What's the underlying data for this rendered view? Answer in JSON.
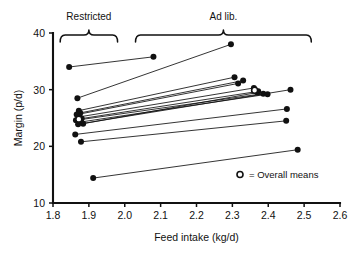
{
  "chart_data": {
    "type": "scatter",
    "title": "",
    "xlabel": "Feed intake (kg/d)",
    "ylabel": "Margin (p/d)",
    "xlim": [
      1.8,
      2.6
    ],
    "ylim": [
      10,
      40
    ],
    "xticks": [
      "1.8",
      "1.9",
      "2.0",
      "2.1",
      "2.2",
      "2.3",
      "2.4",
      "2.5",
      "2.6"
    ],
    "yticks": [
      "10",
      "20",
      "30",
      "40"
    ],
    "grid": false,
    "legend_position": "lower-right",
    "legend": [
      {
        "marker": "open-circle",
        "label": "= Overall means"
      }
    ],
    "annotations": [
      {
        "text": "Restricted",
        "x_range": [
          1.82,
          1.98
        ],
        "position": "top"
      },
      {
        "text": "Ad lib.",
        "x_range": [
          2.03,
          2.52
        ],
        "position": "top"
      }
    ],
    "series": [
      {
        "name": "paired-farms",
        "marker": "filled-circle",
        "pairs": [
          {
            "restricted": [
              1.845,
              34.0
            ],
            "adlib": [
              2.08,
              35.8
            ]
          },
          {
            "restricted": [
              1.868,
              28.5
            ],
            "adlib": [
              2.296,
              38.0
            ]
          },
          {
            "restricted": [
              1.872,
              26.3
            ],
            "adlib": [
              2.306,
              32.2
            ]
          },
          {
            "restricted": [
              1.876,
              25.9
            ],
            "adlib": [
              2.33,
              31.6
            ]
          },
          {
            "restricted": [
              1.866,
              25.6
            ],
            "adlib": [
              2.316,
              31.1
            ]
          },
          {
            "restricted": [
              1.874,
              25.2
            ],
            "adlib": [
              2.36,
              30.3
            ]
          },
          {
            "restricted": [
              1.88,
              24.9
            ],
            "adlib": [
              2.372,
              29.7
            ]
          },
          {
            "restricted": [
              1.864,
              24.6
            ],
            "adlib": [
              2.386,
              29.3
            ]
          },
          {
            "restricted": [
              1.878,
              24.3
            ],
            "adlib": [
              2.398,
              29.2
            ]
          },
          {
            "restricted": [
              1.884,
              24.0
            ],
            "adlib": [
              2.37,
              29.5
            ]
          },
          {
            "restricted": [
              1.87,
              23.9
            ],
            "adlib": [
              2.462,
              30.0
            ]
          },
          {
            "restricted": [
              1.862,
              22.1
            ],
            "adlib": [
              2.452,
              26.6
            ]
          },
          {
            "restricted": [
              1.878,
              20.8
            ],
            "adlib": [
              2.45,
              24.5
            ]
          },
          {
            "restricted": [
              1.912,
              14.4
            ],
            "adlib": [
              2.482,
              19.4
            ]
          }
        ]
      },
      {
        "name": "overall-means",
        "marker": "open-circle",
        "points": [
          {
            "x": 1.872,
            "y": 24.8
          },
          {
            "x": 2.362,
            "y": 29.9
          }
        ]
      }
    ]
  }
}
